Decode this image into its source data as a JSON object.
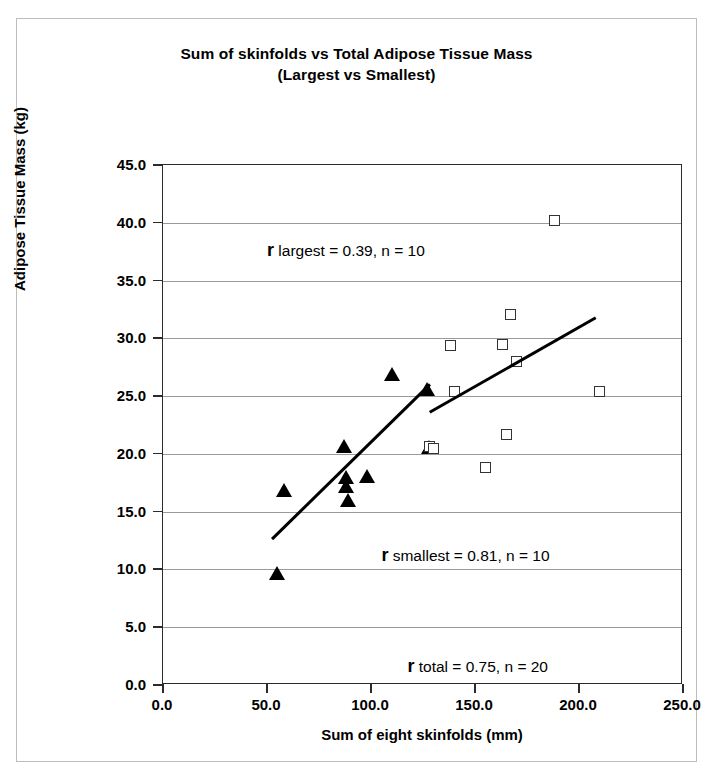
{
  "chart_data": {
    "type": "scatter",
    "title": "Sum of skinfolds vs Total Adipose Tissue Mass",
    "subtitle": "(Largest vs Smallest)",
    "xlabel": "Sum of eight skinfolds (mm)",
    "ylabel": "Adipose Tissue Mass (kg)",
    "xlim": [
      0,
      250
    ],
    "ylim": [
      0,
      45
    ],
    "xticks": [
      "0.0",
      "50.0",
      "100.0",
      "150.0",
      "200.0",
      "250.0"
    ],
    "xtick_values": [
      0,
      50,
      100,
      150,
      200,
      250
    ],
    "yticks": [
      "0.0",
      "5.0",
      "10.0",
      "15.0",
      "20.0",
      "25.0",
      "30.0",
      "35.0",
      "40.0",
      "45.0"
    ],
    "ytick_values": [
      0,
      5,
      10,
      15,
      20,
      25,
      30,
      35,
      40,
      45
    ],
    "grid": "horizontal",
    "legend": "none",
    "series": [
      {
        "name": "Smallest",
        "marker": "filled-triangle",
        "color": "#000000",
        "points": [
          {
            "x": 55,
            "y": 9.7
          },
          {
            "x": 58,
            "y": 16.9
          },
          {
            "x": 87,
            "y": 20.7
          },
          {
            "x": 88,
            "y": 18.0
          },
          {
            "x": 88,
            "y": 17.2
          },
          {
            "x": 89,
            "y": 16.0
          },
          {
            "x": 98,
            "y": 18.1
          },
          {
            "x": 110,
            "y": 26.9
          },
          {
            "x": 127,
            "y": 25.6
          },
          {
            "x": 128,
            "y": 20.6
          }
        ],
        "trendline": {
          "x1": 52,
          "y1": 12.7,
          "x2": 128,
          "y2": 26.1
        }
      },
      {
        "name": "Largest",
        "marker": "open-square",
        "color": "#333333",
        "points": [
          {
            "x": 128,
            "y": 20.6
          },
          {
            "x": 130,
            "y": 20.5
          },
          {
            "x": 138,
            "y": 29.4
          },
          {
            "x": 140,
            "y": 25.4
          },
          {
            "x": 155,
            "y": 18.8
          },
          {
            "x": 163,
            "y": 29.5
          },
          {
            "x": 165,
            "y": 21.7
          },
          {
            "x": 167,
            "y": 32.1
          },
          {
            "x": 170,
            "y": 28.0
          },
          {
            "x": 188,
            "y": 40.2
          },
          {
            "x": 210,
            "y": 25.4
          }
        ],
        "trendline": {
          "x1": 128,
          "y1": 23.7,
          "x2": 208,
          "y2": 31.9
        }
      }
    ],
    "annotations": [
      {
        "id": "r-largest",
        "symbol": "r",
        "text": " largest = 0.39, n = 10",
        "x": 0.2,
        "y": 0.855
      },
      {
        "id": "r-smallest",
        "symbol": "r",
        "text": " smallest = 0.81, n = 10",
        "x": 0.42,
        "y": 0.27
      },
      {
        "id": "r-total",
        "symbol": "r",
        "text": " total = 0.75, n = 20",
        "x": 0.47,
        "y": 0.055
      }
    ]
  }
}
